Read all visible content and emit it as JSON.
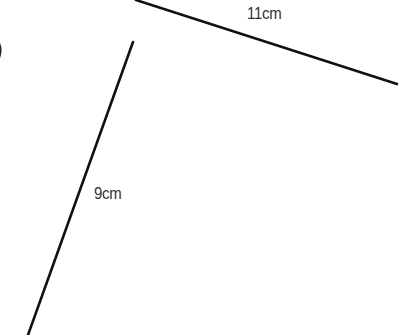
{
  "diagram": {
    "segments": [
      {
        "id": "top-side",
        "label": "11cm",
        "x1": 136,
        "y1": 0,
        "x2": 397,
        "y2": 84
      },
      {
        "id": "left-side",
        "label": "9cm",
        "x1": 133,
        "y1": 42,
        "x2": 28,
        "y2": 335
      }
    ],
    "labels": {
      "top": "11cm",
      "left": "9cm"
    },
    "partial_glyph": ")",
    "colors": {
      "line": "#111111",
      "text": "#333333",
      "background": "#ffffff"
    }
  }
}
